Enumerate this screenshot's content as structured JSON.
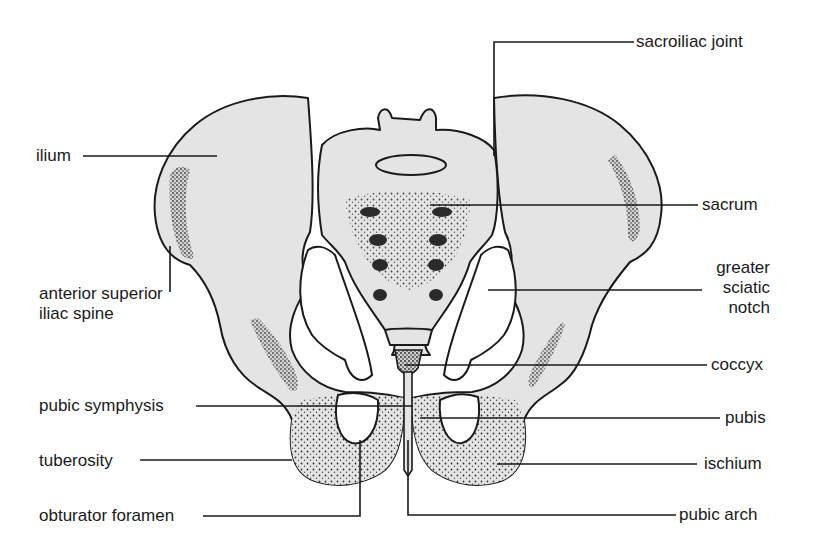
{
  "diagram": {
    "colors": {
      "bone_fill": "#e4e4e4",
      "outline": "#1a1a1a",
      "background": "#ffffff"
    },
    "labels_left": [
      {
        "id": "ilium",
        "text": "ilium"
      },
      {
        "id": "anterior_superior_iliac_spine",
        "line1": "anterior superior",
        "line2": "iliac spine"
      },
      {
        "id": "pubic_symphysis",
        "text": "pubic symphysis"
      },
      {
        "id": "tuberosity",
        "text": "tuberosity"
      },
      {
        "id": "obturator_foramen",
        "text": "obturator foramen"
      }
    ],
    "labels_right": [
      {
        "id": "sacroiliac_joint",
        "text": "sacroiliac joint"
      },
      {
        "id": "sacrum",
        "text": "sacrum"
      },
      {
        "id": "greater_sciatic_notch",
        "line1": "greater",
        "line2": "sciatic",
        "line3": "notch"
      },
      {
        "id": "coccyx",
        "text": "coccyx"
      },
      {
        "id": "pubis",
        "text": "pubis"
      },
      {
        "id": "ischium",
        "text": "ischium"
      },
      {
        "id": "pubic_arch",
        "text": "pubic arch"
      }
    ]
  }
}
